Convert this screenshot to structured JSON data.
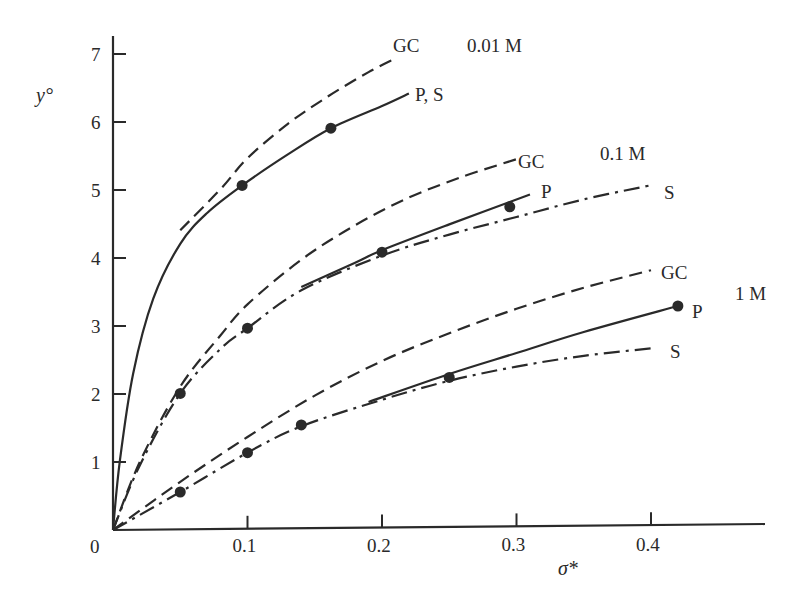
{
  "chart_data": {
    "type": "line",
    "title": "",
    "xlabel": "σ*",
    "ylabel": "y°",
    "xlim": [
      0,
      0.48
    ],
    "ylim": [
      0,
      7.2
    ],
    "grid": false,
    "legend": "inline labels at curve ends",
    "x_ticks": [
      "0",
      "0.1",
      "0.2",
      "0.3",
      "0.4"
    ],
    "y_ticks": [
      "1",
      "2",
      "3",
      "4",
      "5",
      "6",
      "7"
    ],
    "origin_label": "0",
    "groups": [
      {
        "concentration": "0.01 M",
        "series": [
          {
            "name": "GC",
            "style": "dashed",
            "x": [
              0.05,
              0.08,
              0.1,
              0.13,
              0.16,
              0.19,
              0.21
            ],
            "y": [
              4.4,
              5.0,
              5.45,
              5.95,
              6.35,
              6.7,
              6.9
            ]
          },
          {
            "name": "P, S",
            "style": "solid",
            "x": [
              0.0,
              0.005,
              0.015,
              0.03,
              0.05,
              0.07,
              0.096,
              0.13,
              0.162,
              0.2,
              0.22
            ],
            "y": [
              0.0,
              1.0,
              2.3,
              3.4,
              4.2,
              4.65,
              5.05,
              5.5,
              5.88,
              6.2,
              6.38
            ]
          }
        ],
        "points": [
          [
            0.096,
            5.05
          ],
          [
            0.162,
            5.88
          ]
        ]
      },
      {
        "concentration": "0.1 M",
        "series": [
          {
            "name": "GC",
            "style": "dashed",
            "x": [
              0.0,
              0.02,
              0.05,
              0.08,
              0.1,
              0.14,
              0.18,
              0.22,
              0.26,
              0.3
            ],
            "y": [
              0.0,
              1.0,
              2.1,
              2.85,
              3.3,
              3.95,
              4.45,
              4.85,
              5.15,
              5.4
            ]
          },
          {
            "name": "P",
            "style": "solid",
            "x": [
              0.14,
              0.18,
              0.2,
              0.25,
              0.31
            ],
            "y": [
              3.55,
              3.9,
              4.08,
              4.45,
              4.88
            ]
          },
          {
            "name": "S",
            "style": "dash-dot",
            "x": [
              0.0,
              0.02,
              0.05,
              0.08,
              0.1,
              0.14,
              0.2,
              0.25,
              0.3,
              0.35,
              0.4
            ],
            "y": [
              0.0,
              0.95,
              2.0,
              2.65,
              2.95,
              3.5,
              4.0,
              4.3,
              4.55,
              4.8,
              5.0
            ]
          }
        ],
        "points": [
          [
            0.05,
            2.0
          ],
          [
            0.1,
            2.95
          ],
          [
            0.2,
            4.05
          ],
          [
            0.295,
            4.7
          ]
        ]
      },
      {
        "concentration": "1 M",
        "series": [
          {
            "name": "GC",
            "style": "dashed",
            "x": [
              0.0,
              0.05,
              0.1,
              0.15,
              0.2,
              0.25,
              0.3,
              0.35,
              0.4
            ],
            "y": [
              0.0,
              0.7,
              1.35,
              1.95,
              2.45,
              2.85,
              3.2,
              3.5,
              3.75
            ]
          },
          {
            "name": "P",
            "style": "solid",
            "x": [
              0.19,
              0.25,
              0.3,
              0.35,
              0.42
            ],
            "y": [
              1.85,
              2.25,
              2.55,
              2.85,
              3.22
            ]
          },
          {
            "name": "S",
            "style": "dash-dot",
            "x": [
              0.0,
              0.05,
              0.1,
              0.14,
              0.2,
              0.25,
              0.3,
              0.35,
              0.4
            ],
            "y": [
              0.0,
              0.55,
              1.12,
              1.5,
              1.88,
              2.15,
              2.35,
              2.5,
              2.6
            ]
          }
        ],
        "points": [
          [
            0.05,
            0.55
          ],
          [
            0.1,
            1.12
          ],
          [
            0.14,
            1.52
          ],
          [
            0.25,
            2.2
          ],
          [
            0.42,
            3.22
          ]
        ]
      }
    ],
    "labels": {
      "gc_001": "GC",
      "ps_001": "P, S",
      "conc_001": "0.01 M",
      "gc_01": "GC",
      "p_01": "P",
      "s_01": "S",
      "conc_01": "0.1 M",
      "gc_1": "GC",
      "p_1": "P",
      "s_1": "S",
      "conc_1": "1 M"
    }
  }
}
